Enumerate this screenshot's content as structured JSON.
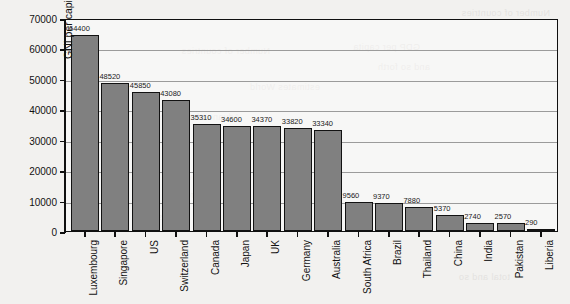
{
  "chart_data": {
    "type": "bar",
    "title": "",
    "xlabel": "",
    "ylabel": "GNI per capita PPP (in US$)",
    "ylim": [
      0,
      70000
    ],
    "ytick_step": 10000,
    "yticks": [
      "70000",
      "60000",
      "50000",
      "40000",
      "30000",
      "20000",
      "10000",
      "0"
    ],
    "grid": true,
    "legend": "none",
    "bar_color": "#808080",
    "bar_edge_color": "#121212",
    "gridline_color": "#9b9b9b",
    "axis_color": "#101010",
    "categories": [
      "Luxembourg",
      "Singapore",
      "US",
      "Switzerland",
      "Canada",
      "Japan",
      "UK",
      "Germany",
      "Australia",
      "South Africa",
      "Brazil",
      "Thailand",
      "China",
      "India",
      "Pakistan",
      "Liberia"
    ],
    "values": [
      64400,
      48520,
      45850,
      43080,
      35310,
      34600,
      34370,
      33820,
      33340,
      9560,
      9370,
      7880,
      5370,
      2740,
      2570,
      290
    ],
    "value_labels": [
      "64400",
      "48520",
      "45850",
      "43080",
      "35310",
      "34600",
      "34370",
      "33820",
      "33340",
      "9560",
      "9370",
      "7880",
      "5370",
      "2740",
      "2570",
      "290"
    ]
  },
  "bleed_text": [
    "Number of countries",
    "Number of countries",
    "GDP per capita",
    "and so forth",
    "estimates World",
    "Advanced economies",
    "from a list",
    "General",
    "French",
    "List",
    "total and so"
  ]
}
